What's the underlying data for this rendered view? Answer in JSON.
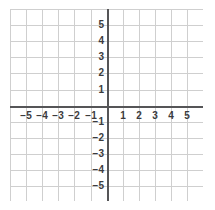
{
  "chart_data": {
    "type": "scatter",
    "title": "",
    "subtitle": "",
    "xlabel": "",
    "ylabel": "",
    "xlim": [
      -6,
      6
    ],
    "ylim": [
      -6,
      6
    ],
    "x_ticks": [
      -5,
      -4,
      -3,
      -2,
      -1,
      1,
      2,
      3,
      4,
      5
    ],
    "y_ticks": [
      5,
      4,
      3,
      2,
      1,
      -1,
      -2,
      -3,
      -4,
      -5
    ],
    "x_tick_labels": [
      "−5",
      "−4",
      "−3",
      "−2",
      "−1",
      "1",
      "2",
      "3",
      "4",
      "5"
    ],
    "y_tick_labels": [
      "5",
      "4",
      "3",
      "2",
      "1",
      "−1",
      "−2",
      "−3",
      "−4",
      "−5"
    ],
    "grid": true,
    "grid_step": 1,
    "legend": "none",
    "series": [],
    "annotations": [],
    "origin_label": "",
    "colors": {
      "gridline": "#cfcfcf",
      "axis": "#555557",
      "label": "#3b3b3d",
      "background": "#ffffff"
    }
  },
  "plot": {
    "name": "cartesian-coordinate-plane",
    "x_axis_name": "x-axis",
    "y_axis_name": "y-axis"
  }
}
